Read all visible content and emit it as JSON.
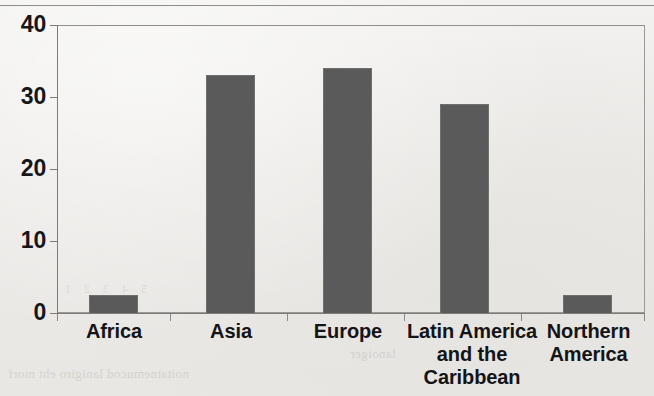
{
  "chart_data": {
    "type": "bar",
    "title": "",
    "subtitle": "",
    "xlabel": "",
    "ylabel": "",
    "categories": [
      "Africa",
      "Asia",
      "Europe",
      "Latin America and the Caribbean",
      "Northern America"
    ],
    "values": [
      2.5,
      33,
      34,
      29,
      2.5
    ],
    "ylim": [
      0,
      40
    ],
    "ytick_values": [
      0,
      10,
      20,
      30,
      40
    ],
    "ytick_labels": [
      "0",
      "10",
      "20",
      "30",
      "40"
    ],
    "grid": false,
    "legend": null,
    "legend_position": "none",
    "bar_color": "#5a5a5a",
    "axis_color": "#7c7b79",
    "background_color": "#efeeec",
    "annotations": []
  },
  "axis": {
    "y_ticks": [
      {
        "label": "40",
        "value": 40
      },
      {
        "label": "30",
        "value": 30
      },
      {
        "label": "20",
        "value": 20
      },
      {
        "label": "10",
        "value": 10
      },
      {
        "label": "0",
        "value": 0
      }
    ]
  },
  "categories": [
    {
      "label": "Africa",
      "lines": [
        "Africa"
      ],
      "value": 2.5
    },
    {
      "label": "Asia",
      "lines": [
        "Asia"
      ],
      "value": 33
    },
    {
      "label": "Europe",
      "lines": [
        "Europe"
      ],
      "value": 34
    },
    {
      "label": "Latin America and the Caribbean",
      "lines": [
        "Latin America",
        "and the",
        "Caribbean"
      ],
      "value": 29
    },
    {
      "label": "Northern America",
      "lines": [
        "Northern",
        "America"
      ],
      "value": 2.5
    }
  ],
  "scan_artifacts": {
    "bleed_line_1": "noitatnemucod lanigiro eht morf",
    "bleed_line_2": "lanoiger",
    "bleed_line_3": "5 4 3 2 1"
  }
}
